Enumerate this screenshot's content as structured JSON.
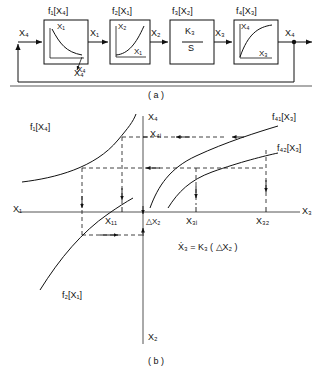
{
  "figure": {
    "panel_a": {
      "caption": "( a )",
      "input_label": "X₄",
      "output_label": "X₄",
      "feedback_label": "X₄",
      "blocks": [
        {
          "title": "f₁[X₄]",
          "y_axis": "X₁",
          "x_axis": "X₄",
          "curve": "decaying-hyperbolic",
          "out_signal": "X₁"
        },
        {
          "title": "f₂[X₁]",
          "y_axis": "X₂",
          "x_axis": "X₁",
          "curve": "rising-convex",
          "out_signal": "X₂"
        },
        {
          "title": "f₃[X₂]",
          "numerator": "K₃",
          "denominator": "S",
          "curve": "none",
          "out_signal": "X₃"
        },
        {
          "title": "f₄[X₃]",
          "y_axis": "X₄",
          "x_axis": "X₃",
          "curve": "saturating-concave",
          "out_signal": "X₄"
        }
      ]
    },
    "panel_b": {
      "caption": "( b )",
      "axes": {
        "up": "X₄",
        "down": "X₂",
        "right": "X₃",
        "left": "X₁"
      },
      "curve_labels": {
        "upper_left": "f₁[X₄]",
        "lower_left": "f₂[X₁]",
        "upper_right_1": "f₄₁[X₃]",
        "upper_right_2": "f₄₂[X₃]"
      },
      "tick_labels": {
        "x4i": "X₄ᵢ",
        "x11": "X₁₁",
        "x3i": "X₃ᵢ",
        "x32": "X₃₂",
        "delta_x2": "△X₂"
      },
      "equation": "Ẋ₃ = K₃ ( △X₂ )"
    }
  }
}
